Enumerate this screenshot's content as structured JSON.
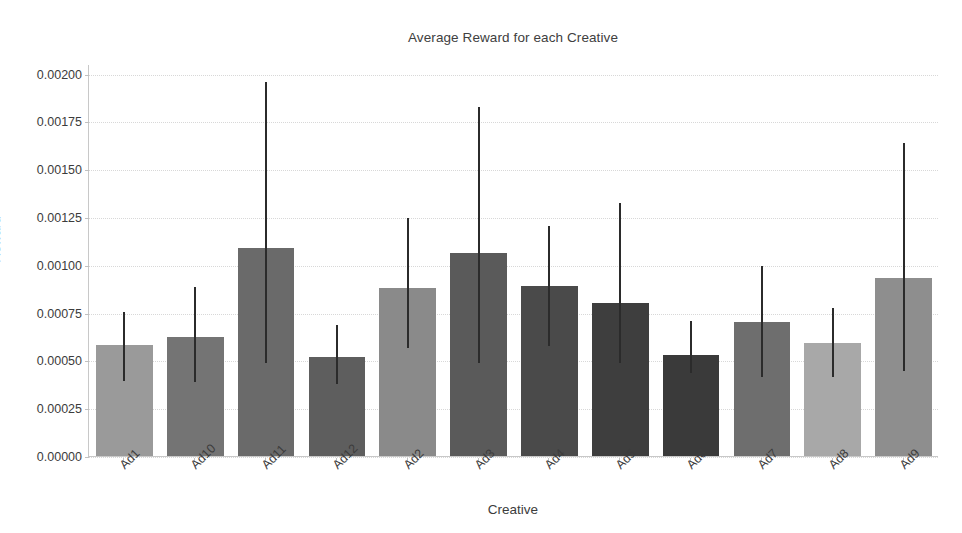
{
  "chart_data": {
    "type": "bar",
    "title": "Average Reward for each Creative",
    "xlabel": "Creative",
    "ylabel": "Reward",
    "categories": [
      "Ad1",
      "Ad10",
      "Ad11",
      "Ad12",
      "Ad2",
      "Ad3",
      "Ad4",
      "Ad5",
      "Ad6",
      "Ad7",
      "Ad8",
      "Ad9"
    ],
    "values": [
      0.00058,
      0.00062,
      0.00109,
      0.00052,
      0.00088,
      0.00106,
      0.00089,
      0.0008,
      0.00053,
      0.0007,
      0.00059,
      0.00093
    ],
    "error_low": [
      0.0004,
      0.00039,
      0.00049,
      0.00038,
      0.00057,
      0.00049,
      0.00058,
      0.00049,
      0.00044,
      0.00042,
      0.00042,
      0.00045
    ],
    "error_high": [
      0.00076,
      0.00089,
      0.00196,
      0.00069,
      0.00125,
      0.00183,
      0.00121,
      0.00133,
      0.00071,
      0.001,
      0.00078,
      0.00164
    ],
    "bar_colors": [
      "#9a9a9a",
      "#747474",
      "#6a6a6a",
      "#5e5e5e",
      "#8a8a8a",
      "#5a5a5a",
      "#4a4a4a",
      "#3e3e3e",
      "#3a3a3a",
      "#6e6e6e",
      "#a8a8a8",
      "#8e8e8e"
    ],
    "errorbar_color": "#2b2b2b",
    "ylim": [
      0.0,
      0.00205
    ],
    "yticks": [
      0.0,
      0.00025,
      0.0005,
      0.00075,
      0.001,
      0.00125,
      0.0015,
      0.00175,
      0.002
    ],
    "ytick_labels": [
      "0.00000",
      "0.00025",
      "0.00050",
      "0.00075",
      "0.00100",
      "0.00125",
      "0.00150",
      "0.00175",
      "0.00200"
    ],
    "grid": true,
    "legend": null,
    "background_color": "#ffffff"
  }
}
